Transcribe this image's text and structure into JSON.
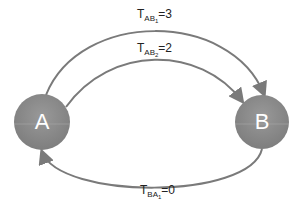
{
  "nodes": [
    {
      "id": "A",
      "label": "A",
      "cx": 42,
      "cy": 122,
      "r": 28
    },
    {
      "id": "B",
      "label": "B",
      "cx": 262,
      "cy": 122,
      "r": 27
    }
  ],
  "edges": [
    {
      "from": "A",
      "to": "B",
      "label_main": "T",
      "label_sub": "AB",
      "label_subsub": "1",
      "label_value": "=3"
    },
    {
      "from": "A",
      "to": "B",
      "label_main": "T",
      "label_sub": "AB",
      "label_subsub": "2",
      "label_value": "=2"
    },
    {
      "from": "B",
      "to": "A",
      "label_main": "T",
      "label_sub": "BA",
      "label_subsub": "1",
      "label_value": "=0"
    }
  ],
  "colors": {
    "node_fill": "#8a8a8a",
    "edge": "#7a7a7a",
    "text": "#222222"
  }
}
